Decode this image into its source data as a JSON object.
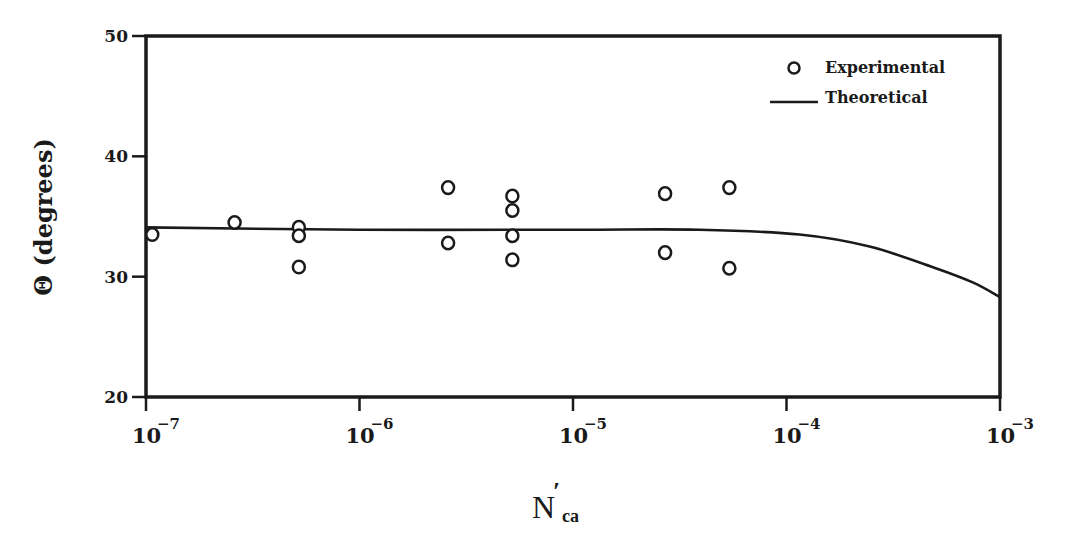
{
  "chart_data": {
    "type": "scatter",
    "title": "",
    "xlabel": "N'ca",
    "xlabel_main": "N",
    "xlabel_prime": "′",
    "xlabel_sub": "ca",
    "ylabel": "Θ (degrees)",
    "xscale": "log",
    "xlim": [
      1e-07,
      0.001
    ],
    "ylim": [
      20,
      50
    ],
    "grid": false,
    "legend_position": "upper right",
    "x_ticks": [
      {
        "base": "10",
        "exp": "−7",
        "value": 1e-07
      },
      {
        "base": "10",
        "exp": "−6",
        "value": 1e-06
      },
      {
        "base": "10",
        "exp": "−5",
        "value": 1e-05
      },
      {
        "base": "10",
        "exp": "−4",
        "value": 0.0001
      },
      {
        "base": "10",
        "exp": "−3",
        "value": 0.001
      }
    ],
    "y_ticks": [
      {
        "label": "50",
        "value": 50
      },
      {
        "label": "40",
        "value": 40
      },
      {
        "label": "30",
        "value": 30
      },
      {
        "label": "20",
        "value": 20
      }
    ],
    "legend": [
      {
        "label": "Experimental",
        "marker": "open-circle"
      },
      {
        "label": "Theoretical",
        "marker": "line"
      }
    ],
    "series": [
      {
        "name": "Experimental",
        "type": "scatter",
        "marker": "open-circle",
        "points": [
          {
            "x": 1.07e-07,
            "y": 33.5
          },
          {
            "x": 2.6e-07,
            "y": 34.5
          },
          {
            "x": 5.2e-07,
            "y": 34.1
          },
          {
            "x": 5.2e-07,
            "y": 33.4
          },
          {
            "x": 5.2e-07,
            "y": 30.8
          },
          {
            "x": 2.6e-06,
            "y": 37.4
          },
          {
            "x": 2.6e-06,
            "y": 32.8
          },
          {
            "x": 5.2e-06,
            "y": 36.7
          },
          {
            "x": 5.2e-06,
            "y": 35.5
          },
          {
            "x": 5.2e-06,
            "y": 33.4
          },
          {
            "x": 5.2e-06,
            "y": 31.4
          },
          {
            "x": 2.7e-05,
            "y": 36.9
          },
          {
            "x": 2.7e-05,
            "y": 32.0
          },
          {
            "x": 5.4e-05,
            "y": 37.4
          },
          {
            "x": 5.4e-05,
            "y": 30.7
          }
        ]
      },
      {
        "name": "Theoretical",
        "type": "line",
        "points": [
          {
            "x": 1e-07,
            "y": 34.1
          },
          {
            "x": 1e-06,
            "y": 33.9
          },
          {
            "x": 1e-05,
            "y": 33.9
          },
          {
            "x": 3.9e-05,
            "y": 33.9
          },
          {
            "x": 0.000115,
            "y": 33.5
          },
          {
            "x": 0.000245,
            "y": 32.5
          },
          {
            "x": 0.0005,
            "y": 30.7
          },
          {
            "x": 0.00075,
            "y": 29.5
          },
          {
            "x": 0.001,
            "y": 28.3
          }
        ]
      }
    ]
  },
  "colors": {
    "ink": "#1a1a1a",
    "background": "#ffffff"
  }
}
